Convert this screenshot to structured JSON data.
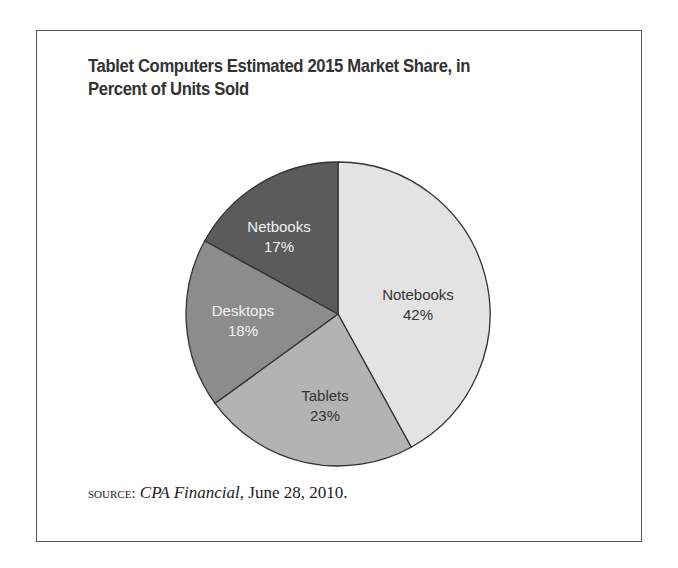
{
  "title": {
    "line1": "Tablet Computers Estimated 2015 Market Share, in",
    "line2": "Percent of Units Sold"
  },
  "source": {
    "prefix": "source:",
    "publication": "CPA Financial",
    "date": ", June 28, 2010."
  },
  "colors": {
    "Notebooks": "#e3e3e3",
    "Tablets": "#b3b3b3",
    "Desktops": "#8c8c8c",
    "Netbooks": "#5b5b5b"
  },
  "chart_data": {
    "type": "pie",
    "title": "Tablet Computers Estimated 2015 Market Share, in Percent of Units Sold",
    "categories": [
      "Notebooks",
      "Tablets",
      "Desktops",
      "Netbooks"
    ],
    "values": [
      42,
      23,
      18,
      17
    ],
    "labels": [
      "42%",
      "23%",
      "18%",
      "17%"
    ],
    "start_angle": "top (12 o'clock), clockwise",
    "legend": "none (labels inside slices)",
    "source": "SOURCE: CPA Financial, June 28, 2010."
  }
}
